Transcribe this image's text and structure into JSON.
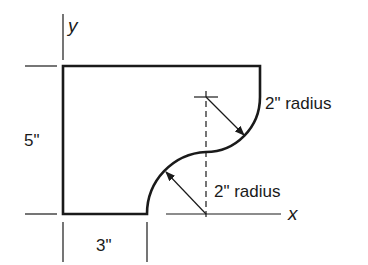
{
  "diagram": {
    "type": "engineering-shape-drawing",
    "colors": {
      "ink": "#1a1a1a",
      "background": "#ffffff"
    },
    "axes": {
      "x_label": "x",
      "y_label": "y"
    },
    "dimensions": {
      "height_label": "5\"",
      "bottom_width_label": "3\""
    },
    "radii": {
      "upper_label": "2\" radius",
      "lower_label": "2\" radius"
    }
  }
}
